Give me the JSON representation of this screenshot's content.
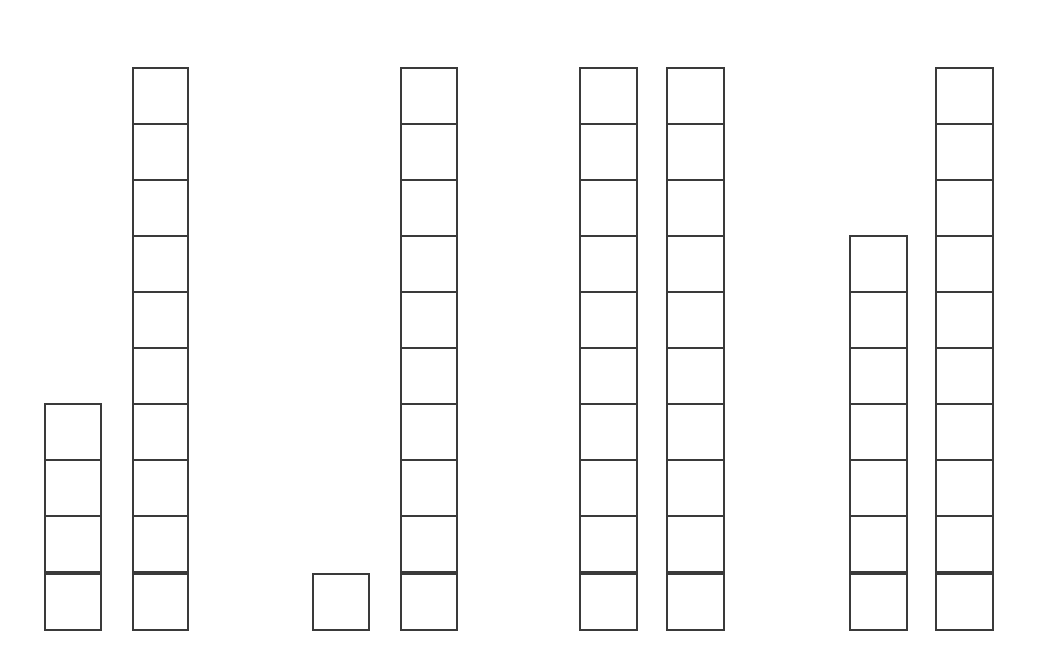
{
  "diagram": {
    "type": "base-ten-blocks",
    "stroke_color": "#3a3a3a",
    "background": "#ffffff",
    "groups": [
      {
        "id": 1,
        "stacks": [
          {
            "count": 4,
            "x": 44,
            "width": 58
          },
          {
            "count": 10,
            "x": 132,
            "width": 57
          }
        ]
      },
      {
        "id": 2,
        "stacks": [
          {
            "count": 1,
            "x": 312,
            "width": 58
          },
          {
            "count": 10,
            "x": 400,
            "width": 58
          }
        ]
      },
      {
        "id": 3,
        "stacks": [
          {
            "count": 10,
            "x": 579,
            "width": 59
          },
          {
            "count": 10,
            "x": 666,
            "width": 59
          }
        ]
      },
      {
        "id": 4,
        "stacks": [
          {
            "count": 7,
            "x": 849,
            "width": 59
          },
          {
            "count": 10,
            "x": 935,
            "width": 59
          }
        ]
      }
    ],
    "baseline_y": 631,
    "cell_height": 58
  }
}
